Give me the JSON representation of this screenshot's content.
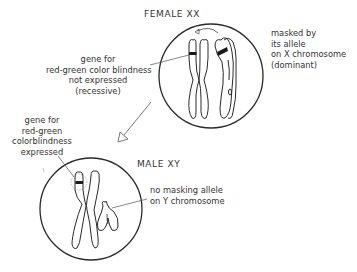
{
  "female": {
    "title": "FEMALE  XX",
    "left_label": {
      "lines": [
        "gene for",
        "red-green color blindness",
        "not expressed",
        "(recessive)"
      ]
    },
    "right_label": {
      "lines": [
        "masked by",
        "its allele",
        "on X chromosome",
        "(dominant)"
      ]
    }
  },
  "male": {
    "title": "MALE  XY",
    "left_label": {
      "lines": [
        "gene for",
        "red-green",
        "colorblindness",
        "expressed"
      ]
    },
    "right_label": {
      "lines": [
        "no masking allele",
        "on Y chromosome"
      ]
    }
  },
  "colors": {
    "stroke": "#2a2a2a",
    "band": "#1a1a1a",
    "leader": "#555555"
  }
}
